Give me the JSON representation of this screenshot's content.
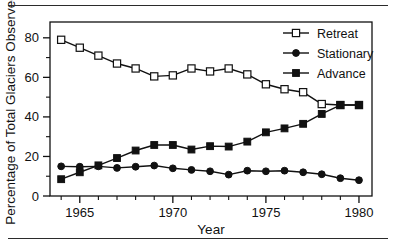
{
  "figure": {
    "has_top_rule": true,
    "has_bottom_rule": true,
    "background": "#ffffff",
    "ink": "#111111"
  },
  "chart_data": {
    "type": "line",
    "title": "",
    "subtitle": "",
    "xlabel": "Year",
    "ylabel": "Percentage of Total Glaciers Observed",
    "xlim": [
      1963.4,
      1980.7
    ],
    "ylim": [
      0,
      88
    ],
    "grid": false,
    "legend_position": "top-right",
    "x_major_ticks": [
      1965,
      1970,
      1975,
      1980
    ],
    "x_major_tick_labels": [
      "1965",
      "1970",
      "1975",
      "1980"
    ],
    "x_minor_ticks": [
      1964,
      1966,
      1967,
      1968,
      1969,
      1971,
      1972,
      1973,
      1974,
      1976,
      1977,
      1978,
      1979
    ],
    "y_major_ticks": [
      0,
      20,
      40,
      60,
      80
    ],
    "y_major_tick_labels": [
      "0",
      "20",
      "40",
      "60",
      "80"
    ],
    "y_minor_ticks": [
      10,
      30,
      50,
      70
    ],
    "x": [
      1964,
      1965,
      1966,
      1967,
      1968,
      1969,
      1970,
      1971,
      1972,
      1973,
      1974,
      1975,
      1976,
      1977,
      1978,
      1979,
      1980
    ],
    "series": [
      {
        "name": "Retreat",
        "marker": "open-square",
        "color": "#111111",
        "fill": "#ffffff",
        "values": [
          79,
          75,
          71,
          67,
          64.5,
          60.5,
          61,
          64.5,
          63,
          64.5,
          61.5,
          56.5,
          54,
          52.5,
          46.5,
          46,
          46
        ]
      },
      {
        "name": "Stationary",
        "marker": "filled-circle",
        "color": "#111111",
        "fill": "#111111",
        "values": [
          15,
          14.8,
          15,
          14.2,
          14.8,
          15.4,
          14,
          13.2,
          12.5,
          10.8,
          12.8,
          12.5,
          12.8,
          12,
          11,
          9,
          8
        ]
      },
      {
        "name": "Advance",
        "marker": "filled-square",
        "color": "#111111",
        "fill": "#111111",
        "values": [
          8.5,
          12,
          15.5,
          19.2,
          23,
          25.8,
          25.8,
          23.5,
          25.2,
          25,
          27.5,
          32.2,
          34.2,
          36.5,
          41.5,
          46,
          46
        ]
      }
    ]
  },
  "legend": {
    "items": [
      {
        "label": "Retreat",
        "marker": "open-square"
      },
      {
        "label": "Stationary",
        "marker": "filled-circle"
      },
      {
        "label": "Advance",
        "marker": "filled-square"
      }
    ]
  }
}
